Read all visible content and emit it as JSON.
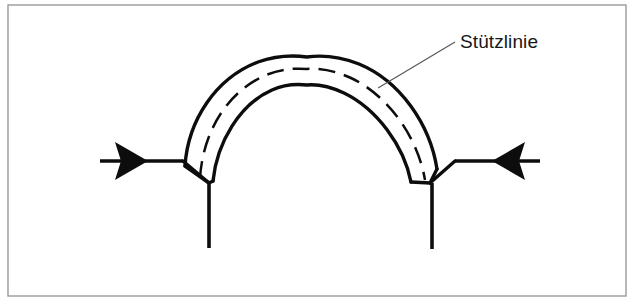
{
  "figure": {
    "background_color": "#ffffff",
    "ink_color": "#0d0d0d",
    "frame_color": "#9a9a9a",
    "label_color": "#17171a",
    "frame": {
      "x": 8,
      "y": 5,
      "width": 618,
      "height": 291
    }
  },
  "labels": {
    "thrust_line": "Stützlinie"
  },
  "annotation": {
    "leader": {
      "from_x": 378,
      "from_y": 88,
      "to_x": 455,
      "to_y": 42
    },
    "text_x": 460,
    "text_y": 48
  },
  "arch": {
    "span_left_x": 185,
    "span_right_x": 452,
    "springing_y": 161,
    "crown_x": 307,
    "crown_outer_y": 57,
    "crown_inner_y": 85,
    "left_haunch_point_x": 209,
    "left_haunch_point_y": 183,
    "right_haunch_point_x": 430,
    "right_haunch_point_y": 183
  },
  "supports": [
    {
      "name": "left-support",
      "force_direction": "right",
      "shaft_start_x": 100,
      "shaft_end_x": 183,
      "shaft_y": 161,
      "arrow_tip_x": 148,
      "arrow_back_x": 115,
      "arrow_half_height": 19,
      "pier_x": 209,
      "pier_top_y": 183,
      "pier_bottom_y": 248
    },
    {
      "name": "right-support",
      "force_direction": "left",
      "shaft_start_x": 540,
      "shaft_end_x": 455,
      "shaft_y": 161,
      "arrow_tip_x": 492,
      "arrow_back_x": 524,
      "arrow_half_height": 19,
      "pier_x": 432,
      "pier_top_y": 183,
      "pier_bottom_y": 249
    }
  ],
  "geometry": {
    "extrados_path": "M 185,166 C 188,120 216,78 258,62 C 275,56 292,55 307,57 C 322,55 341,57 359,64 C 400,81 430,124 437,169",
    "intrados_path": "M 213,181 C 217,142 240,104 272,90 C 285,84 297,84 307,85 C 318,84 331,87 344,93 C 377,109 404,146 411,182",
    "thrust_path": "M 200,178 C 203,131 228,92 264,76 C 279,69 294,68 307,69 C 320,68 336,71 351,78 C 389,96 418,138 425,180",
    "left_joint_path": "M 183,161 L 209,183 L 213,181",
    "left_joint_outer": "M 185,166 L 209,183",
    "right_joint_path": "M 455,161 L 430,183 L 411,182",
    "right_joint_outer": "M 437,169 L 430,183"
  }
}
